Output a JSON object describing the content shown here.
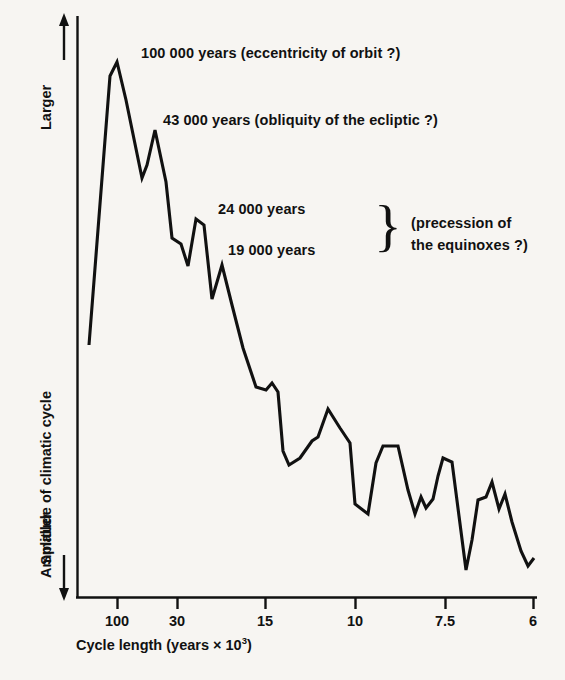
{
  "chart_data": {
    "type": "line",
    "title": "",
    "subtitle": "",
    "xlabel": "Cycle length (years × 10³)",
    "ylabel": "Amplitude of climatic cycle",
    "y_axis_direction_top": "Larger",
    "y_axis_direction_bottom": "Smaller",
    "grid": false,
    "legend": "none",
    "x_tick_labels": [
      "100",
      "30",
      "15",
      "10",
      "7.5",
      "6"
    ],
    "x_tick_values": [
      100,
      30,
      15,
      10,
      7.5,
      6
    ],
    "x_tick_px": [
      117,
      177,
      265,
      355,
      445,
      533
    ],
    "xlim_px": [
      77,
      537
    ],
    "ylim_px": [
      16,
      598
    ],
    "axis_note": "x axis is cycle length in thousands of years, decreasing left to right (frequency increasing); y axis is unlabelled relative amplitude",
    "series": [
      {
        "name": "Amplitude of climatic cycle",
        "color": "#111111",
        "points_px": [
          [
            89,
            345
          ],
          [
            110,
            76
          ],
          [
            117,
            62
          ],
          [
            126,
            100
          ],
          [
            142,
            178
          ],
          [
            147,
            165
          ],
          [
            155,
            130
          ],
          [
            166,
            182
          ],
          [
            172,
            238
          ],
          [
            181,
            244
          ],
          [
            188,
            266
          ],
          [
            196,
            219
          ],
          [
            204,
            225
          ],
          [
            212,
            299
          ],
          [
            222,
            265
          ],
          [
            232,
            305
          ],
          [
            243,
            348
          ],
          [
            256,
            387
          ],
          [
            266,
            390
          ],
          [
            272,
            383
          ],
          [
            278,
            392
          ],
          [
            283,
            451
          ],
          [
            289,
            465
          ],
          [
            300,
            458
          ],
          [
            312,
            441
          ],
          [
            318,
            437
          ],
          [
            328,
            409
          ],
          [
            340,
            428
          ],
          [
            350,
            443
          ],
          [
            355,
            504
          ],
          [
            368,
            514
          ],
          [
            376,
            463
          ],
          [
            383,
            446
          ],
          [
            398,
            446
          ],
          [
            408,
            490
          ],
          [
            415,
            514
          ],
          [
            421,
            497
          ],
          [
            426,
            508
          ],
          [
            433,
            499
          ],
          [
            438,
            476
          ],
          [
            443,
            458
          ],
          [
            452,
            462
          ],
          [
            459,
            516
          ],
          [
            466,
            570
          ],
          [
            472,
            540
          ],
          [
            478,
            500
          ],
          [
            486,
            497
          ],
          [
            492,
            482
          ],
          [
            499,
            509
          ],
          [
            505,
            494
          ],
          [
            512,
            522
          ],
          [
            521,
            551
          ],
          [
            528,
            566
          ],
          [
            534,
            558
          ]
        ],
        "values_described": "relative amplitude, arbitrary units, peaks at 100k, 43k, 24k and 19k year cycles"
      }
    ],
    "annotations": [
      {
        "id": "anno-100000",
        "text": "100 000 years (eccentricity of orbit ?)",
        "cycle_years": 100000
      },
      {
        "id": "anno-43000",
        "text": "43 000 years (obliquity of the ecliptic ?)",
        "cycle_years": 43000
      },
      {
        "id": "anno-24000",
        "text": "24 000 years",
        "cycle_years": 24000
      },
      {
        "id": "anno-19000",
        "text": "19 000 years",
        "cycle_years": 19000
      },
      {
        "id": "anno-precession",
        "line1": "(precession of",
        "line2": "the equinoxes ?)"
      }
    ]
  },
  "axes": {
    "x_ticks": [
      {
        "label": "100",
        "px": 117
      },
      {
        "label": "30",
        "px": 177
      },
      {
        "label": "15",
        "px": 265
      },
      {
        "label": "10",
        "px": 355
      },
      {
        "label": "7.5",
        "px": 445
      },
      {
        "label": "6",
        "px": 533
      }
    ],
    "x_title_main": "Cycle length (years × 10",
    "x_title_sup": "3",
    "x_title_tail": ")",
    "y_title": "Amplitude of climatic cycle",
    "y_top_label": "Larger",
    "y_bottom_label": "Smaller"
  },
  "annotations": {
    "eccentricity": "100 000 years (eccentricity of orbit ?)",
    "obliquity": "43 000 years (obliquity of the ecliptic ?)",
    "precession_24k": "24 000 years",
    "precession_19k": "19 000 years",
    "precession_label_line1": "(precession of",
    "precession_label_line2": "the equinoxes ?)",
    "brace_glyph": "}"
  },
  "colors": {
    "background": "#f7f5f2",
    "ink": "#111111",
    "curve": "#111111"
  }
}
